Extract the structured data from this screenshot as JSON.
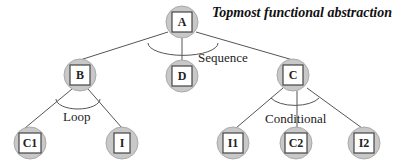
{
  "title": "Topmost functional abstraction",
  "nodes": {
    "A": {
      "label": "A"
    },
    "B": {
      "label": "B"
    },
    "D": {
      "label": "D"
    },
    "C": {
      "label": "C"
    },
    "C1": {
      "label": "C1"
    },
    "I": {
      "label": "I"
    },
    "I1": {
      "label": "I1"
    },
    "C2": {
      "label": "C2"
    },
    "I2": {
      "label": "I2"
    }
  },
  "edges": [
    [
      "A",
      "B"
    ],
    [
      "A",
      "D"
    ],
    [
      "A",
      "C"
    ],
    [
      "B",
      "C1"
    ],
    [
      "B",
      "I"
    ],
    [
      "C",
      "I1"
    ],
    [
      "C",
      "C2"
    ],
    [
      "C",
      "I2"
    ]
  ],
  "constructs": {
    "sequence": "Sequence",
    "loop": "Loop",
    "conditional": "Conditional"
  },
  "colors": {
    "node_fill": "#c8c8c8",
    "box_fill": "#ffffff",
    "line": "#555555"
  }
}
